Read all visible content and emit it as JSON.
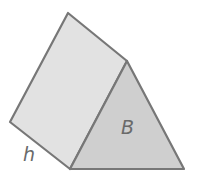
{
  "figure": {
    "type": "triangular prism",
    "labels": {
      "base": "B",
      "height": "h"
    },
    "colors": {
      "stroke": "#777777",
      "side_face_fill": "#e2e2e2",
      "base_face_fill": "#cfcfcf",
      "label": "#6a6a6a"
    }
  }
}
